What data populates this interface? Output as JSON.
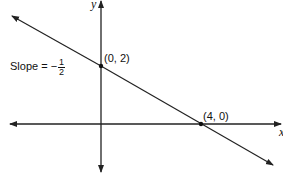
{
  "diagram": {
    "type": "coordinate-plane-line",
    "axes": {
      "x_label": "x",
      "y_label": "y"
    },
    "line": {
      "equation_note": "line through (0, 2) and (4, 0)",
      "slope": "-1/2"
    },
    "points": [
      {
        "label": "(0, 2)"
      },
      {
        "label": "(4, 0)"
      }
    ],
    "slope_label": {
      "prefix": "Slope = −",
      "numerator": "1",
      "denominator": "2"
    }
  }
}
